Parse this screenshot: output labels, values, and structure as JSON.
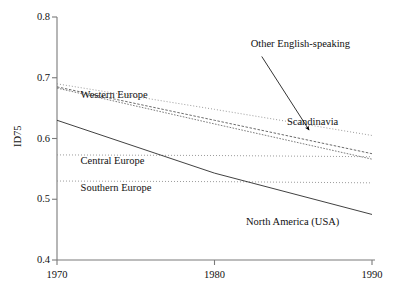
{
  "chart_data": {
    "type": "line",
    "title": "",
    "xlabel": "",
    "ylabel": "ID75",
    "xlim": [
      1970,
      1990
    ],
    "ylim": [
      0.4,
      0.8
    ],
    "xticks": [
      "1970",
      "1980",
      "1990"
    ],
    "xtick_values": [
      1970,
      1980,
      1990
    ],
    "yticks": [
      "0.4",
      "0.5",
      "0.6",
      "0.7",
      "0.8"
    ],
    "ytick_values": [
      0.4,
      0.5,
      0.6,
      0.7,
      0.8
    ],
    "grid": false,
    "legend_position": "inline-annotations",
    "x": [
      1970,
      1980,
      1990
    ],
    "series": [
      {
        "name": "Scandinavia",
        "values": [
          0.69,
          0.648,
          0.605
        ],
        "style": "dotted",
        "label_x": 1984.6,
        "label_y": 0.628
      },
      {
        "name": "Other English-speaking",
        "values": [
          0.685,
          0.63,
          0.575
        ],
        "style": "dashed",
        "label_x": 1982.3,
        "label_y": 0.755
      },
      {
        "name": "Western Europe",
        "values": [
          0.683,
          0.624,
          0.566
        ],
        "style": "dashed-fine",
        "label_x": 1971.5,
        "label_y": 0.672
      },
      {
        "name": "Central Europe",
        "values": [
          0.573,
          0.572,
          0.57
        ],
        "style": "dotted",
        "label_x": 1971.5,
        "label_y": 0.563
      },
      {
        "name": "Southern Europe",
        "values": [
          0.53,
          0.529,
          0.527
        ],
        "style": "dotted",
        "label_x": 1971.5,
        "label_y": 0.518
      },
      {
        "name": "North America (USA)",
        "values": [
          0.63,
          0.543,
          0.475
        ],
        "style": "solid",
        "label_x": 1982.0,
        "label_y": 0.463
      }
    ],
    "annotations": [
      {
        "text": "Other English-speaking",
        "arrow_from_x": 1983.0,
        "arrow_from_y": 0.735,
        "arrow_to_x": 1986.0,
        "arrow_to_y": 0.614
      }
    ]
  },
  "axis": {
    "y_axis_title": "ID75"
  }
}
